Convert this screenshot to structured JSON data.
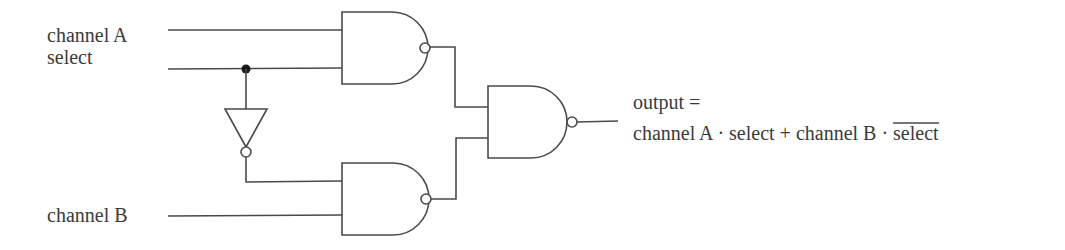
{
  "diagram": {
    "colors": {
      "line": "#4a4a4a",
      "text": "#3a3a3a",
      "junction": "#1a1a1a",
      "background": "#ffffff"
    },
    "inputs": {
      "channel_a": "channel A",
      "select": "select",
      "channel_b": "channel B"
    },
    "output": {
      "line1": "output =",
      "expr_part1": "channel A · select + channel B · ",
      "expr_inverted": "select"
    },
    "components": [
      {
        "id": "nand-1",
        "type": "NAND",
        "inputs": [
          "channel A",
          "select"
        ]
      },
      {
        "id": "inverter",
        "type": "NOT",
        "inputs": [
          "select"
        ]
      },
      {
        "id": "nand-2",
        "type": "NAND",
        "inputs": [
          "select (inverted)",
          "channel B"
        ]
      },
      {
        "id": "nand-3",
        "type": "NAND",
        "inputs": [
          "nand-1 output",
          "nand-2 output"
        ]
      }
    ]
  }
}
